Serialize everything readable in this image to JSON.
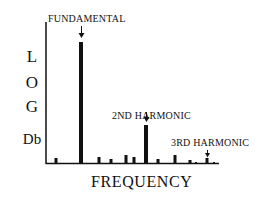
{
  "chart_data": {
    "type": "bar",
    "title": "",
    "xlabel": "FREQUENCY",
    "ylabel": "LOG Db",
    "ylabel_lines": [
      "L",
      "O",
      "G",
      "Db"
    ],
    "grid": false,
    "axis_color": "#111111",
    "bar_color": "#111111",
    "annotations": [
      {
        "text": "FUNDAMENTAL",
        "target_index": 1
      },
      {
        "text": "2ND HARMONIC",
        "target_index": 6
      },
      {
        "text": "3RD HARMONIC",
        "target_index": 11
      }
    ],
    "bars": [
      {
        "x": 56,
        "height": 5,
        "width": 3
      },
      {
        "x": 81,
        "height": 121,
        "width": 4
      },
      {
        "x": 99,
        "height": 6,
        "width": 3
      },
      {
        "x": 111,
        "height": 4,
        "width": 3
      },
      {
        "x": 126,
        "height": 8,
        "width": 3
      },
      {
        "x": 134,
        "height": 6,
        "width": 3
      },
      {
        "x": 146,
        "height": 38,
        "width": 4
      },
      {
        "x": 158,
        "height": 4,
        "width": 3
      },
      {
        "x": 175,
        "height": 8,
        "width": 3
      },
      {
        "x": 190,
        "height": 3,
        "width": 3
      },
      {
        "x": 196,
        "height": 1,
        "width": 2
      },
      {
        "x": 207,
        "height": 5,
        "width": 3
      },
      {
        "x": 214,
        "height": 1,
        "width": 2
      }
    ]
  },
  "labels": {
    "fundamental": "FUNDAMENTAL",
    "second_harmonic": "2ND HARMONIC",
    "third_harmonic": "3RD HARMONIC",
    "x_axis": "FREQUENCY",
    "y_l": "L",
    "y_o": "O",
    "y_g": "G",
    "y_db": "Db"
  }
}
